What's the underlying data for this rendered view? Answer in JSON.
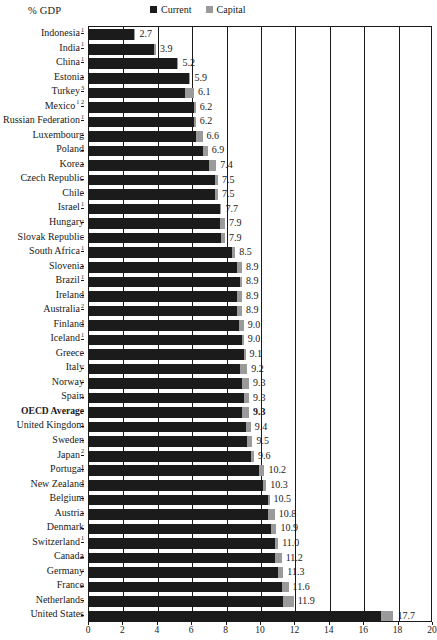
{
  "chart_data": {
    "type": "bar",
    "orientation": "horizontal",
    "stacked": true,
    "title": "",
    "ylabel": "% GDP",
    "xlabel": "",
    "xlim": [
      0,
      20
    ],
    "xticks": [
      0,
      2,
      4,
      6,
      8,
      10,
      12,
      14,
      16,
      18,
      20
    ],
    "grid": "vertical",
    "legend_position": "top-center",
    "legend": [
      {
        "name": "Current",
        "color": "#1b1b1b"
      },
      {
        "name": "Capital",
        "color": "#9a9a9a"
      }
    ],
    "series": [
      {
        "name": "Current",
        "color": "#1b1b1b"
      },
      {
        "name": "Capital",
        "color": "#9a9a9a"
      }
    ],
    "categories": [
      "Indonesia",
      "India",
      "China",
      "Estonia",
      "Turkey",
      "Mexico",
      "Russian Federation",
      "Luxembourg",
      "Poland",
      "Korea",
      "Czech Republic",
      "Chile",
      "Israel",
      "Hungary",
      "Slovak Republic",
      "South Africa",
      "Slovenia",
      "Brazil",
      "Ireland",
      "Australia",
      "Finland",
      "Iceland",
      "Greece",
      "Italy",
      "Norway",
      "Spain",
      "OECD Average",
      "United Kingdom",
      "Sweden",
      "Japan",
      "Portugal",
      "New Zealand",
      "Belgium",
      "Austria",
      "Denmark",
      "Switzerland",
      "Canada",
      "Germany",
      "France",
      "Netherlands",
      "United States"
    ],
    "values": [
      2.7,
      3.9,
      5.2,
      5.9,
      6.1,
      6.2,
      6.2,
      6.6,
      6.9,
      7.4,
      7.5,
      7.5,
      7.7,
      7.9,
      7.9,
      8.5,
      8.9,
      8.9,
      8.9,
      8.9,
      9.0,
      9.0,
      9.1,
      9.2,
      9.3,
      9.3,
      9.3,
      9.4,
      9.5,
      9.6,
      10.2,
      10.3,
      10.5,
      10.8,
      10.9,
      11.0,
      11.2,
      11.3,
      11.6,
      11.9,
      17.7
    ],
    "rows": [
      {
        "label": "Indonesia",
        "notes": "1",
        "current": 2.6,
        "capital": 0.1,
        "total": "2.7",
        "bold": false
      },
      {
        "label": "India",
        "notes": "1",
        "current": 3.8,
        "capital": 0.1,
        "total": "3.9",
        "bold": false
      },
      {
        "label": "China",
        "notes": "1",
        "current": 5.1,
        "capital": 0.1,
        "total": "5.2",
        "bold": false
      },
      {
        "label": "Estonia",
        "notes": "",
        "current": 5.8,
        "capital": 0.1,
        "total": "5.9",
        "bold": false
      },
      {
        "label": "Turkey",
        "notes": "3",
        "current": 5.6,
        "capital": 0.5,
        "total": "6.1",
        "bold": false
      },
      {
        "label": "Mexico",
        "notes": "1 2",
        "current": 6.1,
        "capital": 0.1,
        "total": "6.2",
        "bold": false
      },
      {
        "label": "Russian Federation",
        "notes": "1",
        "current": 6.1,
        "capital": 0.1,
        "total": "6.2",
        "bold": false
      },
      {
        "label": "Luxembourg",
        "notes": "",
        "current": 6.2,
        "capital": 0.4,
        "total": "6.6",
        "bold": false
      },
      {
        "label": "Poland",
        "notes": "",
        "current": 6.6,
        "capital": 0.3,
        "total": "6.9",
        "bold": false
      },
      {
        "label": "Korea",
        "notes": "",
        "current": 7.0,
        "capital": 0.4,
        "total": "7.4",
        "bold": false
      },
      {
        "label": "Czech Republic",
        "notes": "",
        "current": 7.3,
        "capital": 0.2,
        "total": "7.5",
        "bold": false
      },
      {
        "label": "Chile",
        "notes": "",
        "current": 7.3,
        "capital": 0.2,
        "total": "7.5",
        "bold": false
      },
      {
        "label": "Israel",
        "notes": "1",
        "current": 7.6,
        "capital": 0.1,
        "total": "7.7",
        "bold": false
      },
      {
        "label": "Hungary",
        "notes": "",
        "current": 7.6,
        "capital": 0.3,
        "total": "7.9",
        "bold": false
      },
      {
        "label": "Slovak Republic",
        "notes": "",
        "current": 7.7,
        "capital": 0.2,
        "total": "7.9",
        "bold": false
      },
      {
        "label": "South Africa",
        "notes": "1",
        "current": 8.3,
        "capital": 0.2,
        "total": "8.5",
        "bold": false
      },
      {
        "label": "Slovenia",
        "notes": "",
        "current": 8.6,
        "capital": 0.3,
        "total": "8.9",
        "bold": false
      },
      {
        "label": "Brazil",
        "notes": "1",
        "current": 8.8,
        "capital": 0.1,
        "total": "8.9",
        "bold": false
      },
      {
        "label": "Ireland",
        "notes": "",
        "current": 8.6,
        "capital": 0.3,
        "total": "8.9",
        "bold": false
      },
      {
        "label": "Australia",
        "notes": "2",
        "current": 8.6,
        "capital": 0.3,
        "total": "8.9",
        "bold": false
      },
      {
        "label": "Finland",
        "notes": "",
        "current": 8.7,
        "capital": 0.3,
        "total": "9.0",
        "bold": false
      },
      {
        "label": "Iceland",
        "notes": "1",
        "current": 8.9,
        "capital": 0.1,
        "total": "9.0",
        "bold": false
      },
      {
        "label": "Greece",
        "notes": "",
        "current": 9.0,
        "capital": 0.1,
        "total": "9.1",
        "bold": false
      },
      {
        "label": "Italy",
        "notes": "",
        "current": 8.8,
        "capital": 0.4,
        "total": "9.2",
        "bold": false
      },
      {
        "label": "Norway",
        "notes": "",
        "current": 8.9,
        "capital": 0.4,
        "total": "9.3",
        "bold": false
      },
      {
        "label": "Spain",
        "notes": "",
        "current": 9.0,
        "capital": 0.3,
        "total": "9.3",
        "bold": false
      },
      {
        "label": "OECD Average",
        "notes": "",
        "current": 8.9,
        "capital": 0.4,
        "total": "9.3",
        "bold": true
      },
      {
        "label": "United Kingdom",
        "notes": "",
        "current": 9.1,
        "capital": 0.3,
        "total": "9.4",
        "bold": false
      },
      {
        "label": "Sweden",
        "notes": "",
        "current": 9.2,
        "capital": 0.3,
        "total": "9.5",
        "bold": false
      },
      {
        "label": "Japan",
        "notes": "2",
        "current": 9.4,
        "capital": 0.2,
        "total": "9.6",
        "bold": false
      },
      {
        "label": "Portugal",
        "notes": "",
        "current": 9.9,
        "capital": 0.3,
        "total": "10.2",
        "bold": false
      },
      {
        "label": "New Zealand",
        "notes": "",
        "current": 10.1,
        "capital": 0.2,
        "total": "10.3",
        "bold": false
      },
      {
        "label": "Belgium",
        "notes": "",
        "current": 10.4,
        "capital": 0.1,
        "total": "10.5",
        "bold": false
      },
      {
        "label": "Austria",
        "notes": "",
        "current": 10.4,
        "capital": 0.4,
        "total": "10.8",
        "bold": false
      },
      {
        "label": "Denmark",
        "notes": "",
        "current": 10.6,
        "capital": 0.3,
        "total": "10.9",
        "bold": false
      },
      {
        "label": "Switzerland",
        "notes": "1",
        "current": 10.8,
        "capital": 0.2,
        "total": "11.0",
        "bold": false
      },
      {
        "label": "Canada",
        "notes": "",
        "current": 10.8,
        "capital": 0.4,
        "total": "11.2",
        "bold": false
      },
      {
        "label": "Germany",
        "notes": "",
        "current": 11.0,
        "capital": 0.3,
        "total": "11.3",
        "bold": false
      },
      {
        "label": "France",
        "notes": "",
        "current": 11.2,
        "capital": 0.4,
        "total": "11.6",
        "bold": false
      },
      {
        "label": "Netherlands",
        "notes": "",
        "current": 11.3,
        "capital": 0.6,
        "total": "11.9",
        "bold": false
      },
      {
        "label": "United States",
        "notes": "",
        "current": 17.0,
        "capital": 0.7,
        "total": "17.7",
        "bold": false
      }
    ]
  },
  "colors": {
    "current": "#1b1b1b",
    "capital": "#9a9a9a",
    "axis": "#1a1a1a",
    "background": "#ffffff"
  }
}
